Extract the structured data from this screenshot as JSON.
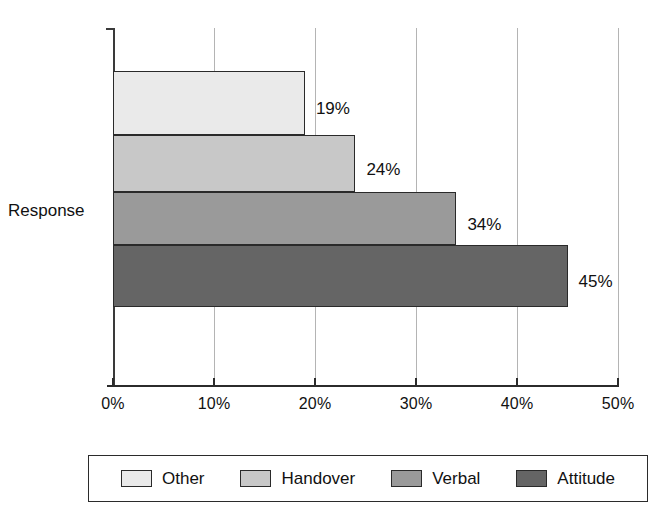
{
  "chart_data": {
    "type": "bar",
    "orientation": "horizontal",
    "title": "",
    "xlabel": "",
    "ylabel": "Response",
    "categories": [
      "Other",
      "Handover",
      "Verbal",
      "Attitude"
    ],
    "values": [
      19,
      24,
      34,
      45
    ],
    "value_labels": [
      "19%",
      "24%",
      "34%",
      "45%"
    ],
    "xlim": [
      0,
      50
    ],
    "xtick_values": [
      0,
      10,
      20,
      30,
      40,
      50
    ],
    "xtick_labels": [
      "0%",
      "10%",
      "20%",
      "30%",
      "40%",
      "50%"
    ],
    "grid": true,
    "grid_axis": "x",
    "legend_position": "bottom",
    "series_colors": [
      "#eaeaea",
      "#c8c8c8",
      "#9a9a9a",
      "#656565"
    ],
    "bar_border_color": "#2a2a2a",
    "gridline_color": "#b4b4b4",
    "axis_color": "#2b2b2b",
    "background": "#ffffff",
    "bars": [
      {
        "label": "Other",
        "value": 19,
        "value_label": "19%",
        "color": "#eaeaea"
      },
      {
        "label": "Handover",
        "value": 24,
        "value_label": "24%",
        "color": "#c8c8c8"
      },
      {
        "label": "Verbal",
        "value": 34,
        "value_label": "34%",
        "color": "#9a9a9a"
      },
      {
        "label": "Attitude",
        "value": 45,
        "value_label": "45%",
        "color": "#656565"
      }
    ]
  },
  "axis": {
    "category_title": "Response",
    "ticks": [
      {
        "label": "0%",
        "value": 0
      },
      {
        "label": "10%",
        "value": 10
      },
      {
        "label": "20%",
        "value": 20
      },
      {
        "label": "30%",
        "value": 30
      },
      {
        "label": "40%",
        "value": 40
      },
      {
        "label": "50%",
        "value": 50
      }
    ]
  },
  "legend": {
    "items": [
      {
        "label": "Other",
        "color": "#eaeaea"
      },
      {
        "label": "Handover",
        "color": "#c8c8c8"
      },
      {
        "label": "Verbal",
        "color": "#9a9a9a"
      },
      {
        "label": "Attitude",
        "color": "#656565"
      }
    ]
  }
}
